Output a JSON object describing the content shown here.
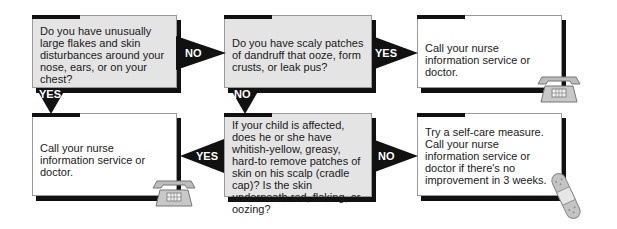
{
  "flowchart": {
    "nodes": [
      {
        "id": "q1",
        "type": "question",
        "text": "Do you have unusually large flakes and skin disturbances around your nose, ears, or on your chest?"
      },
      {
        "id": "q2",
        "type": "question",
        "text": "Do you have scaly patches of dandruff that ooze, form crusts, or leak pus?"
      },
      {
        "id": "a1",
        "type": "outcome",
        "text": "Call your nurse information service or doctor.",
        "icon": "telephone-icon"
      },
      {
        "id": "a2",
        "type": "outcome",
        "text": "Call your nurse information service or doctor.",
        "icon": "telephone-icon"
      },
      {
        "id": "q3",
        "type": "question",
        "text": "If your child is affected, does he or she have whitish-yellow, greasy, hard-to remove patches of skin on his scalp (cradle cap)? Is the skin underneath red, flaking, or oozing?"
      },
      {
        "id": "a3",
        "type": "outcome",
        "text": "Try a self-care measure. Call your nurse information service or doctor if there's no improvement in 3 weeks.",
        "icon": "bandage-icon"
      }
    ],
    "edges": [
      {
        "from": "q1",
        "to": "q2",
        "label": "NO"
      },
      {
        "from": "q1",
        "to": "a2",
        "label": "YES"
      },
      {
        "from": "q2",
        "to": "a1",
        "label": "YES"
      },
      {
        "from": "q2",
        "to": "q3",
        "label": "NO"
      },
      {
        "from": "q3",
        "to": "a2",
        "label": "YES"
      },
      {
        "from": "q3",
        "to": "a3",
        "label": "NO"
      }
    ]
  },
  "colors": {
    "question_fill": "#e4e4e4",
    "outcome_fill": "#ffffff",
    "arrow": "#111111",
    "shadow": "#111111"
  }
}
